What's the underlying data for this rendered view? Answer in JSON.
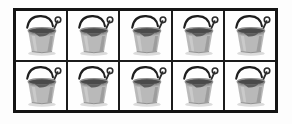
{
  "figure": {
    "name": "bucket-grid",
    "background_color": "#fdfdfd",
    "border_color": "#141414",
    "divider_color": "#1b1b1b",
    "cell_background": "#fefefe",
    "rows": 2,
    "columns": 5,
    "total_items": 10
  },
  "item": {
    "label": "bucket",
    "alt_text": "gray sand pail with wire handle and shovel",
    "colors": {
      "body": "#b9b9b9",
      "body_shadow": "#8e8e8e",
      "body_highlight": "#d6d6d6",
      "rim": "#a3a3a3",
      "interior": "#4a4a4a",
      "handle": "#1e1e1e",
      "shovel": "#2b2b2b",
      "ground_shadow": "#cfcfcf"
    }
  },
  "cells": [
    {
      "id": "r1c1",
      "row": 1,
      "col": 1,
      "label": "bucket"
    },
    {
      "id": "r1c2",
      "row": 1,
      "col": 2,
      "label": "bucket"
    },
    {
      "id": "r1c3",
      "row": 1,
      "col": 3,
      "label": "bucket"
    },
    {
      "id": "r1c4",
      "row": 1,
      "col": 4,
      "label": "bucket"
    },
    {
      "id": "r1c5",
      "row": 1,
      "col": 5,
      "label": "bucket"
    },
    {
      "id": "r2c1",
      "row": 2,
      "col": 1,
      "label": "bucket"
    },
    {
      "id": "r2c2",
      "row": 2,
      "col": 2,
      "label": "bucket"
    },
    {
      "id": "r2c3",
      "row": 2,
      "col": 3,
      "label": "bucket"
    },
    {
      "id": "r2c4",
      "row": 2,
      "col": 4,
      "label": "bucket"
    },
    {
      "id": "r2c5",
      "row": 2,
      "col": 5,
      "label": "bucket"
    }
  ]
}
